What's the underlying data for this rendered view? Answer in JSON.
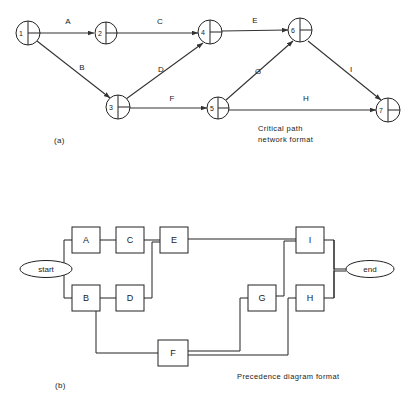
{
  "figure": {
    "panels": [
      {
        "id": "a",
        "label": "(a)",
        "caption_line1": "Critical path",
        "caption_line2": "network format",
        "type": "activity-on-arrow-network"
      },
      {
        "id": "b",
        "label": "(b)",
        "caption_line1": "Precedence diagram format",
        "caption_line2": "",
        "type": "precedence-diagram"
      }
    ]
  },
  "network": {
    "nodes": [
      {
        "id": "n1",
        "number": "1",
        "cx": 28,
        "cy": 33,
        "r": 12
      },
      {
        "id": "n2",
        "number": "2",
        "cx": 106,
        "cy": 33,
        "r": 11
      },
      {
        "id": "n3",
        "number": "3",
        "cx": 118,
        "cy": 107,
        "r": 12
      },
      {
        "id": "n4",
        "number": "4",
        "cx": 210,
        "cy": 32,
        "r": 12
      },
      {
        "id": "n5",
        "number": "5",
        "cx": 218,
        "cy": 108,
        "r": 11
      },
      {
        "id": "n6",
        "number": "6",
        "cx": 300,
        "cy": 30,
        "r": 12
      },
      {
        "id": "n7",
        "number": "7",
        "cx": 388,
        "cy": 110,
        "r": 12
      }
    ],
    "edges": [
      {
        "id": "eA",
        "label": "A",
        "from": "n1",
        "to": "n2",
        "lx": 68,
        "ly": 24
      },
      {
        "id": "eB",
        "label": "B",
        "from": "n1",
        "to": "n3",
        "lx": 82,
        "ly": 68
      },
      {
        "id": "eC",
        "label": "C",
        "from": "n2",
        "to": "n4",
        "lx": 160,
        "ly": 24
      },
      {
        "id": "eD",
        "label": "D",
        "from": "n3",
        "to": "n4",
        "lx": 161,
        "ly": 70
      },
      {
        "id": "eE",
        "label": "E",
        "from": "n4",
        "to": "n6",
        "lx": 255,
        "ly": 22
      },
      {
        "id": "eF",
        "label": "F",
        "from": "n3",
        "to": "n5",
        "lx": 172,
        "ly": 100
      },
      {
        "id": "eG",
        "label": "G",
        "from": "n5",
        "to": "n6",
        "lx": 258,
        "ly": 72
      },
      {
        "id": "eH",
        "label": "H",
        "from": "n5",
        "to": "n7",
        "lx": 305,
        "ly": 100
      },
      {
        "id": "eI",
        "label": "I",
        "from": "n6",
        "to": "n7",
        "lx": 350,
        "ly": 70
      }
    ]
  },
  "precedence": {
    "terminals": [
      {
        "id": "t-start",
        "label": "start",
        "cx": 46,
        "cy": 269,
        "rx": 26,
        "ry": 8
      },
      {
        "id": "t-end",
        "label": "end",
        "cx": 370,
        "cy": 269,
        "rx": 24,
        "ry": 8
      }
    ],
    "activities": [
      {
        "id": "bA",
        "label": "A",
        "x": 72,
        "y": 227,
        "w": 28,
        "h": 26
      },
      {
        "id": "bC",
        "label": "C",
        "x": 116,
        "y": 227,
        "w": 28,
        "h": 26
      },
      {
        "id": "bE",
        "label": "E",
        "x": 160,
        "y": 227,
        "w": 28,
        "h": 26
      },
      {
        "id": "bI",
        "label": "I",
        "x": 296,
        "y": 227,
        "w": 28,
        "h": 26
      },
      {
        "id": "bB",
        "label": "B",
        "x": 72,
        "y": 285,
        "w": 28,
        "h": 26
      },
      {
        "id": "bD",
        "label": "D",
        "x": 116,
        "y": 285,
        "w": 28,
        "h": 26
      },
      {
        "id": "bG",
        "label": "G",
        "x": 248,
        "y": 285,
        "w": 28,
        "h": 26
      },
      {
        "id": "bH",
        "label": "H",
        "x": 296,
        "y": 285,
        "w": 28,
        "h": 26
      },
      {
        "id": "bF",
        "label": "F",
        "x": 158,
        "y": 340,
        "w": 30,
        "h": 26
      }
    ],
    "links": [
      {
        "id": "l-start-split",
        "from": "start",
        "to": "A,B"
      },
      {
        "id": "l-A-C",
        "from": "A",
        "to": "C"
      },
      {
        "id": "l-C-E",
        "from": "C",
        "to": "E"
      },
      {
        "id": "l-B-D",
        "from": "B",
        "to": "D"
      },
      {
        "id": "l-D-E",
        "from": "D",
        "to": "E"
      },
      {
        "id": "l-E-I",
        "from": "E",
        "to": "I"
      },
      {
        "id": "l-B-F",
        "from": "B",
        "to": "F"
      },
      {
        "id": "l-F-G",
        "from": "F",
        "to": "G"
      },
      {
        "id": "l-F-H",
        "from": "F",
        "to": "H"
      },
      {
        "id": "l-G-I",
        "from": "G",
        "to": "I"
      },
      {
        "id": "l-I-end",
        "from": "I",
        "to": "end"
      },
      {
        "id": "l-H-end",
        "from": "H",
        "to": "end"
      }
    ]
  },
  "colors": {
    "ink": "#222222",
    "paper": "#ffffff"
  }
}
